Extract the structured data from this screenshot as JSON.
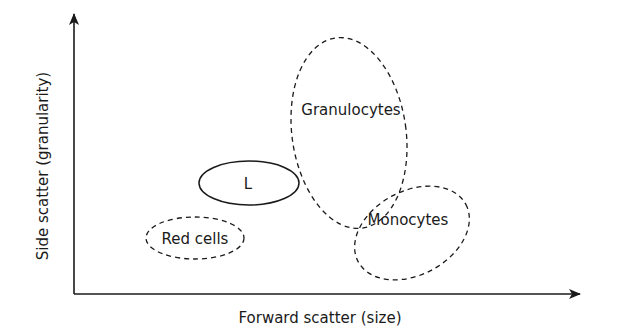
{
  "diagram": {
    "type": "flow-cytometry-scatter-schematic",
    "x_axis": {
      "label": "Forward scatter (size)"
    },
    "y_axis": {
      "label": "Side scatter (granularity)"
    },
    "populations": [
      {
        "id": "lymphocytes",
        "label": "L",
        "outline": "solid",
        "cx": 249,
        "cy": 183,
        "rx": 50,
        "ry": 22,
        "rotate": 0
      },
      {
        "id": "red-cells",
        "label": "Red cells",
        "outline": "dashed",
        "cx": 195,
        "cy": 238,
        "rx": 49,
        "ry": 21,
        "rotate": 0
      },
      {
        "id": "granulocytes",
        "label": "Granulocytes",
        "outline": "dashed",
        "cx": 349,
        "cy": 133,
        "rx": 57,
        "ry": 96,
        "rotate": -8
      },
      {
        "id": "monocytes",
        "label": "Monocytes",
        "outline": "dashed",
        "cx": 412,
        "cy": 233,
        "rx": 60,
        "ry": 42,
        "rotate": -28
      }
    ],
    "colors": {
      "stroke": "#1a1a1a",
      "background": "#ffffff"
    }
  }
}
